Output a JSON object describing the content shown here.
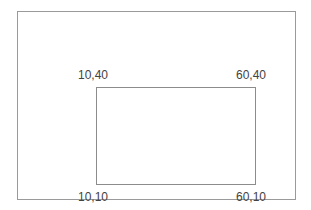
{
  "figure": {
    "type": "geometry-diagram",
    "background_color": "#ffffff",
    "frame": {
      "name": "outer-frame",
      "border_color": "#9a9a9a"
    },
    "shape": {
      "name": "rectangle",
      "border_color": "#8c8c8c",
      "fill": "none"
    },
    "text_color": "#434343",
    "labels": {
      "top_left": "10,40",
      "top_right": "60,40",
      "bottom_left": "10,10",
      "bottom_right": "60,10"
    }
  },
  "chart_data": {
    "type": "scatter",
    "title": "",
    "xlabel": "",
    "ylabel": "",
    "annotations": [
      "10,40",
      "60,40",
      "10,10",
      "60,10"
    ],
    "points": [
      {
        "label": "10,40",
        "x": 10,
        "y": 40
      },
      {
        "label": "60,40",
        "x": 60,
        "y": 40
      },
      {
        "label": "60,10",
        "x": 60,
        "y": 10
      },
      {
        "label": "10,10",
        "x": 10,
        "y": 10
      }
    ],
    "shape": "rectangle",
    "grid": false,
    "legend": "none"
  }
}
